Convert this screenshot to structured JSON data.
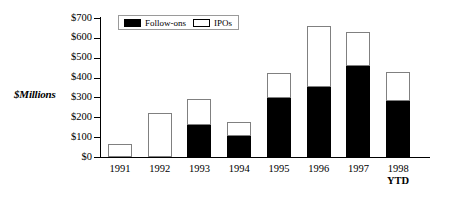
{
  "chart_data": {
    "type": "bar",
    "stacked": true,
    "title": "",
    "subtitle": "",
    "xlabel": "",
    "ylabel": "$Millions",
    "categories": [
      "1991",
      "1992",
      "1993",
      "1994",
      "1995",
      "1996",
      "1997",
      "1998 YTD"
    ],
    "category_labels": [
      {
        "line1": "1991",
        "line2": ""
      },
      {
        "line1": "1992",
        "line2": ""
      },
      {
        "line1": "1993",
        "line2": ""
      },
      {
        "line1": "1994",
        "line2": ""
      },
      {
        "line1": "1995",
        "line2": ""
      },
      {
        "line1": "1996",
        "line2": ""
      },
      {
        "line1": "1997",
        "line2": ""
      },
      {
        "line1": "1998",
        "line2": "YTD"
      }
    ],
    "series": [
      {
        "name": "Follow-ons",
        "color": "#000000",
        "values": [
          0,
          0,
          162,
          108,
          298,
          354,
          458,
          284
        ]
      },
      {
        "name": "IPOs",
        "color": "#FFFFFF",
        "values": [
          67,
          223,
          130,
          68,
          124,
          304,
          170,
          142
        ]
      }
    ],
    "totals": [
      67,
      223,
      292,
      176,
      422,
      658,
      628,
      426
    ],
    "ylim": [
      0,
      700
    ],
    "ytick_values": [
      0,
      100,
      200,
      300,
      400,
      500,
      600,
      700
    ],
    "ytick_labels": [
      "$0",
      "$100",
      "$200",
      "$300",
      "$400",
      "$500",
      "$600",
      "$700"
    ],
    "grid": false,
    "legend_position": "top-left-inside",
    "legend_entries": [
      "Follow-ons",
      "IPOs"
    ]
  },
  "legend": {
    "follow_ons_label": "Follow-ons",
    "ipos_label": "IPOs"
  },
  "axes": {
    "y_title": "$Millions"
  }
}
